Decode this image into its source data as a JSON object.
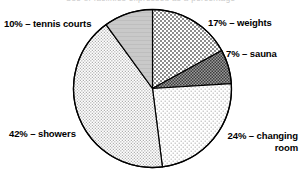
{
  "figure": {
    "width": 301,
    "height": 170,
    "background": "#ffffff",
    "title_strip_text": "Use of facilities expressed as a percentage"
  },
  "chart_data": {
    "type": "pie",
    "title": "",
    "xlabel": "",
    "ylabel": "",
    "legend_position": "none",
    "grid": false,
    "start_angle_deg": 0,
    "direction": "clockwise",
    "center": {
      "x": 152.5,
      "y": 88.5
    },
    "radius": 79,
    "total_percent": 100,
    "categories": [
      "weights",
      "sauna",
      "changing room",
      "showers",
      "tennis courts"
    ],
    "values": [
      17,
      7,
      24,
      42,
      10
    ],
    "slices": [
      {
        "name": "weights",
        "value": 17,
        "label": "17% – weights",
        "fill": "#d2d2d2",
        "pattern": "checker-medium",
        "stroke": "#000000"
      },
      {
        "name": "sauna",
        "value": 7,
        "label": "7% – sauna",
        "fill": "#8c8c8c",
        "pattern": "checker-dense",
        "stroke": "#000000"
      },
      {
        "name": "changing room",
        "value": 24,
        "label": "24% – changing\nroom",
        "fill": "#ededed",
        "pattern": "dots-sparse",
        "stroke": "#000000"
      },
      {
        "name": "showers",
        "value": 42,
        "label": "42% – showers",
        "fill": "#e2e2e2",
        "pattern": "dots-fine",
        "stroke": "#000000"
      },
      {
        "name": "tennis courts",
        "value": 10,
        "label": "10% – tennis courts",
        "fill": "#c9c9c9",
        "pattern": "solid-gray",
        "stroke": "#000000"
      }
    ]
  }
}
